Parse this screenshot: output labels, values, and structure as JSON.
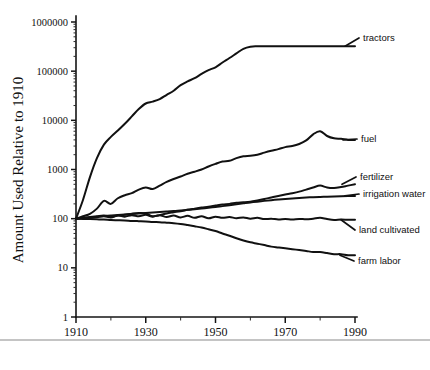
{
  "figure": {
    "background": "#ffffff",
    "ink_color": "#111111"
  },
  "chart_data": {
    "type": "line",
    "title": "",
    "subtitle": "",
    "xlabel": "",
    "ylabel": "Amount Used Relative to 1910",
    "xlim": [
      1910,
      1990
    ],
    "ylim": [
      1,
      1000000
    ],
    "yscale": "log",
    "xscale": "linear",
    "grid": false,
    "legend_position": "right-inline-labels",
    "x_ticks": [
      1910,
      1930,
      1950,
      1970,
      1990
    ],
    "x_tick_labels": [
      "1910",
      "1930",
      "1950",
      "1970",
      "1990"
    ],
    "x_minor_ticks": [
      1920,
      1940,
      1960,
      1980
    ],
    "y_ticks": [
      1,
      10,
      100,
      1000,
      10000,
      100000,
      1000000
    ],
    "y_tick_labels": [
      "1",
      "10",
      "100",
      "1000",
      "10000",
      "100000",
      "1000000"
    ],
    "annotations": [
      {
        "name": "tractors",
        "text": "tractors",
        "x": 1990,
        "y": 300000
      },
      {
        "name": "fuel",
        "text": "fuel",
        "x": 1990,
        "y": 4000
      },
      {
        "name": "fertilizer",
        "text": "fertilizer",
        "x": 1990,
        "y": 520
      },
      {
        "name": "irrigation-water",
        "text": "irrigation water",
        "x": 1990,
        "y": 290
      },
      {
        "name": "land-cultivated",
        "text": "land cultivated",
        "x": 1990,
        "y": 95
      },
      {
        "name": "farm-labor",
        "text": "farm labor",
        "x": 1990,
        "y": 18
      }
    ],
    "x": [
      1910,
      1912,
      1914,
      1916,
      1918,
      1920,
      1922,
      1924,
      1926,
      1928,
      1930,
      1932,
      1934,
      1936,
      1938,
      1940,
      1942,
      1944,
      1946,
      1948,
      1950,
      1952,
      1954,
      1956,
      1958,
      1960,
      1962,
      1964,
      1966,
      1968,
      1970,
      1972,
      1974,
      1976,
      1978,
      1980,
      1982,
      1984,
      1986,
      1988,
      1990
    ],
    "series": [
      {
        "name": "tractors",
        "label": "tractors",
        "values": [
          100,
          240,
          700,
          1700,
          3200,
          4600,
          6200,
          8500,
          12000,
          17000,
          22000,
          24000,
          27000,
          33000,
          40000,
          52000,
          62000,
          72000,
          88000,
          105000,
          120000,
          150000,
          185000,
          230000,
          285000,
          315000,
          320000,
          322000,
          322000,
          322000,
          322000,
          322000,
          322000,
          322000,
          322000,
          322000,
          322000,
          322000,
          322000,
          322000,
          322000
        ]
      },
      {
        "name": "fuel",
        "label": "fuel",
        "values": [
          100,
          112,
          125,
          160,
          230,
          200,
          260,
          300,
          330,
          390,
          430,
          400,
          470,
          560,
          640,
          720,
          820,
          900,
          1000,
          1150,
          1300,
          1450,
          1500,
          1700,
          1850,
          1900,
          2000,
          2200,
          2400,
          2600,
          2850,
          3000,
          3300,
          3900,
          5200,
          6000,
          4800,
          4300,
          4200,
          4000,
          4000
        ]
      },
      {
        "name": "fertilizer",
        "label": "fertilizer",
        "values": [
          100,
          104,
          108,
          112,
          116,
          110,
          116,
          120,
          126,
          130,
          128,
          112,
          118,
          128,
          135,
          142,
          152,
          160,
          168,
          175,
          185,
          195,
          200,
          210,
          215,
          222,
          235,
          250,
          270,
          290,
          310,
          330,
          355,
          390,
          430,
          470,
          430,
          420,
          440,
          470,
          500
        ]
      },
      {
        "name": "irrigation-water",
        "label": "irrigation water",
        "values": [
          100,
          103,
          106,
          110,
          113,
          116,
          119,
          122,
          125,
          128,
          131,
          134,
          137,
          140,
          143,
          147,
          151,
          156,
          161,
          166,
          172,
          180,
          188,
          196,
          205,
          214,
          222,
          230,
          238,
          245,
          252,
          258,
          264,
          269,
          273,
          277,
          280,
          283,
          285,
          288,
          290
        ]
      },
      {
        "name": "land-cultivated",
        "label": "land cultivated",
        "values": [
          100,
          102,
          104,
          108,
          112,
          106,
          116,
          110,
          118,
          112,
          120,
          110,
          118,
          108,
          116,
          106,
          114,
          104,
          112,
          102,
          110,
          104,
          108,
          102,
          106,
          100,
          104,
          98,
          100,
          96,
          98,
          96,
          99,
          97,
          100,
          104,
          98,
          94,
          96,
          95,
          95
        ]
      },
      {
        "name": "farm-labor",
        "label": "farm labor",
        "values": [
          100,
          99,
          98,
          97,
          96,
          94,
          93,
          92,
          90,
          89,
          88,
          86,
          85,
          83,
          81,
          78,
          74,
          70,
          66,
          61,
          56,
          50,
          45,
          40,
          36,
          33,
          31,
          29,
          27,
          26,
          25,
          24,
          23,
          22,
          21,
          21,
          20,
          19,
          19,
          18,
          18
        ]
      }
    ]
  }
}
